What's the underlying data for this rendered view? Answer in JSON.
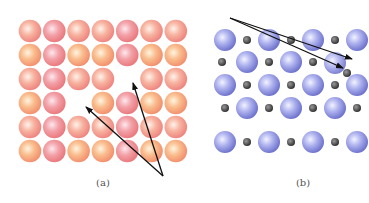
{
  "figure": {
    "panels": [
      {
        "id": "a",
        "label": "(a)",
        "description": "Vacancy defects in a simple square lattice",
        "lattice": {
          "columns": 7,
          "rows": 6,
          "origin_x": 30,
          "origin_y": 31,
          "spacing_x": 24.3,
          "spacing_y": 24,
          "radius": 11.3,
          "vacancies": [
            [
              2,
              4
            ],
            [
              3,
              2
            ]
          ],
          "colors": [
            "#f08a8a",
            "#f5a070",
            "#f29090",
            "#f7a77a"
          ]
        },
        "arrows": {
          "origin": [
            163,
            176
          ],
          "targets": [
            [
              86,
              107
            ],
            [
              133,
              83
            ]
          ]
        }
      },
      {
        "id": "b",
        "label": "(b)",
        "description": "Interstitial/Frenkel-type defect in an ionic lattice",
        "lattice": {
          "large_color": "#8a90e0",
          "small_color": "#3a3a3a",
          "large_radius": 11,
          "small_radius": 4,
          "rows": [
            {
              "y": 40,
              "large_x": [
                225,
                269,
                313,
                357
              ],
              "small_x": [
                247,
                291,
                335
              ]
            },
            {
              "y": 62,
              "large_x": [
                247,
                291
              ],
              "small_x": [
                222,
                269,
                313
              ]
            },
            {
              "y": 85,
              "large_x": [
                225,
                269,
                313,
                357
              ],
              "small_x": [
                247,
                291,
                335
              ]
            },
            {
              "y": 108,
              "large_x": [
                247,
                291,
                335
              ],
              "small_x": [
                225,
                269,
                313,
                357
              ]
            },
            {
              "y": 142,
              "large_x": [
                225,
                269,
                313,
                357
              ],
              "small_x": [
                247,
                291,
                335
              ]
            }
          ],
          "interstitial_large": [
            [
              335,
              63
            ]
          ],
          "interstitial_small": [
            [
              347,
              73
            ]
          ]
        },
        "arrows": {
          "origin": [
            230,
            18
          ],
          "targets": [
            [
              352,
              59
            ],
            [
              343,
              68
            ]
          ]
        }
      }
    ],
    "captions": [
      {
        "text": "(a)",
        "x": 103,
        "y": 179
      },
      {
        "text": "(b)",
        "x": 303,
        "y": 179
      }
    ]
  }
}
